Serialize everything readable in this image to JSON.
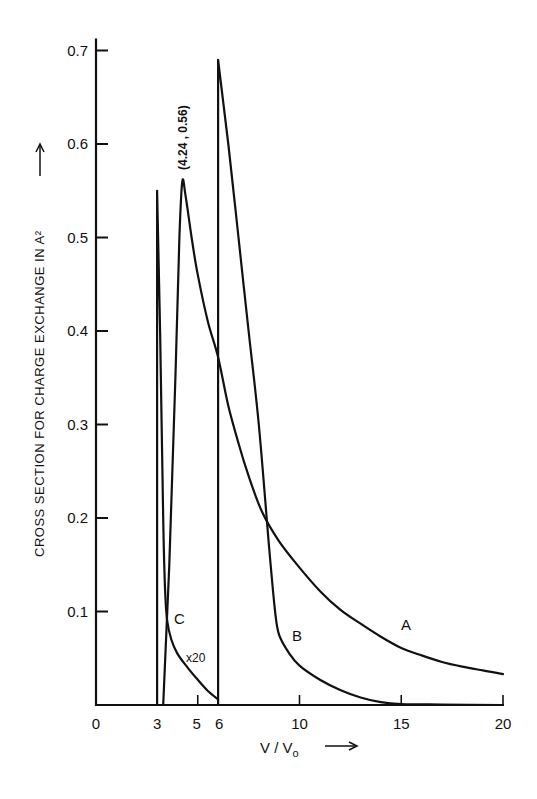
{
  "chart_data": {
    "type": "line",
    "title": "",
    "xlabel": "V / V₀",
    "ylabel": "CROSS SECTION FOR CHARGE EXCHANGE IN A²",
    "xlim": [
      0,
      20
    ],
    "ylim": [
      0,
      0.7
    ],
    "grid": false,
    "legend": "none (curves labeled inline)",
    "x_ticks": [
      0,
      3,
      5,
      6,
      10,
      15,
      20
    ],
    "x_tick_labels": [
      "0",
      "3",
      "5",
      "6",
      "10",
      "15",
      "20"
    ],
    "y_ticks": [
      0.1,
      0.2,
      0.3,
      0.4,
      0.5,
      0.6,
      0.7
    ],
    "y_tick_labels": [
      "0.1",
      "0.2",
      "0.3",
      "0.4",
      "0.5",
      "0.6",
      "0.7"
    ],
    "series": [
      {
        "name": "A",
        "x": [
          3.3,
          3.6,
          3.9,
          4.1,
          4.24,
          4.4,
          4.7,
          5.0,
          5.5,
          6.0,
          6.5,
          7.0,
          7.5,
          8.15,
          9.0,
          10,
          11,
          12,
          13,
          14,
          15,
          16,
          17,
          18,
          19,
          20
        ],
        "y": [
          0.0,
          0.15,
          0.35,
          0.5,
          0.56,
          0.545,
          0.5,
          0.46,
          0.41,
          0.372,
          0.32,
          0.28,
          0.245,
          0.207,
          0.175,
          0.147,
          0.122,
          0.102,
          0.087,
          0.073,
          0.061,
          0.053,
          0.046,
          0.041,
          0.037,
          0.033
        ]
      },
      {
        "name": "B",
        "x": [
          6.0,
          6.0,
          6.5,
          7.0,
          7.5,
          8.0,
          8.5,
          8.8,
          9.0,
          9.5,
          10,
          11,
          12,
          13,
          14,
          15,
          17,
          20
        ],
        "y": [
          0.0,
          0.69,
          0.6,
          0.5,
          0.4,
          0.3,
          0.17,
          0.1,
          0.075,
          0.055,
          0.042,
          0.027,
          0.016,
          0.008,
          0.003,
          0.001,
          0.0005,
          0.0
        ]
      },
      {
        "name": "C (x20)",
        "x": [
          3.0,
          3.0,
          3.15,
          3.3,
          3.4,
          3.5,
          3.7,
          4.0,
          4.5,
          5.0,
          5.5,
          6.0
        ],
        "y": [
          0.0,
          0.55,
          0.4,
          0.2,
          0.12,
          0.09,
          0.07,
          0.055,
          0.04,
          0.027,
          0.015,
          0.006
        ]
      }
    ],
    "annotations": [
      {
        "text": "(4.24 , 0.56)",
        "x": 4.24,
        "y": 0.56,
        "rotation": -90
      },
      {
        "text": "A",
        "x": 15.3,
        "y": 0.088
      },
      {
        "text": "B",
        "x": 10.0,
        "y": 0.075
      },
      {
        "text": "C",
        "x": 4.1,
        "y": 0.093
      },
      {
        "text": "x20",
        "x": 5.0,
        "y": 0.05
      }
    ]
  },
  "labels": {
    "curve_a": "A",
    "curve_b": "B",
    "curve_c": "C",
    "scale_note": "x20",
    "peak_annotation": "(4.24 , 0.56)",
    "ylabel": "CROSS SECTION FOR CHARGE EXCHANGE IN A²",
    "xlabel_main": "V / V",
    "xlabel_sub": "o"
  }
}
